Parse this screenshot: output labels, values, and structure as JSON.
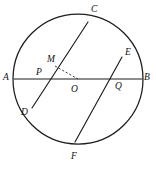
{
  "figure": {
    "background_color": "#ffffff",
    "stroke_color": "#1c1c1c",
    "label_color": "#111111"
  },
  "circle": {
    "center_x": 78,
    "center_y": 79,
    "radius": 65
  },
  "points": {
    "A": {
      "label": "A",
      "x": 14,
      "y": 79,
      "label_x": 3,
      "label_y": 73
    },
    "B": {
      "label": "B",
      "x": 142,
      "y": 79,
      "label_x": 144,
      "label_y": 73
    },
    "C": {
      "label": "C",
      "x": 88,
      "y": 22,
      "label_x": 91,
      "label_y": 5
    },
    "D": {
      "label": "D",
      "x": 32,
      "y": 108,
      "label_x": 21,
      "label_y": 108
    },
    "E": {
      "label": "E",
      "x": 122,
      "y": 57,
      "label_x": 125,
      "label_y": 48
    },
    "F": {
      "label": "F",
      "x": 75,
      "y": 142,
      "label_x": 71,
      "label_y": 152
    },
    "M": {
      "label": "M",
      "x": 55,
      "y": 66,
      "label_x": 47,
      "label_y": 55
    },
    "O": {
      "label": "O",
      "x": 78,
      "y": 79,
      "label_x": 71,
      "label_y": 85
    },
    "P": {
      "label": "P",
      "x": 44,
      "y": 79,
      "label_x": 36,
      "label_y": 68
    },
    "Q": {
      "label": "Q",
      "x": 116,
      "y": 79,
      "label_x": 115,
      "label_y": 82
    }
  },
  "segments": {
    "diameter_AB": {
      "name": "AB",
      "from": "A",
      "to": "B",
      "style": "solid"
    },
    "chord_CD": {
      "name": "CD",
      "from": "C",
      "to": "D",
      "style": "solid"
    },
    "chord_EF": {
      "name": "EF",
      "from": "E",
      "to": "F",
      "style": "solid"
    },
    "perpendicular_MO": {
      "name": "MO",
      "from": "M",
      "to": "O",
      "style": "dashed"
    }
  },
  "labels_order": [
    "A",
    "B",
    "C",
    "D",
    "E",
    "F",
    "M",
    "O",
    "P",
    "Q"
  ]
}
